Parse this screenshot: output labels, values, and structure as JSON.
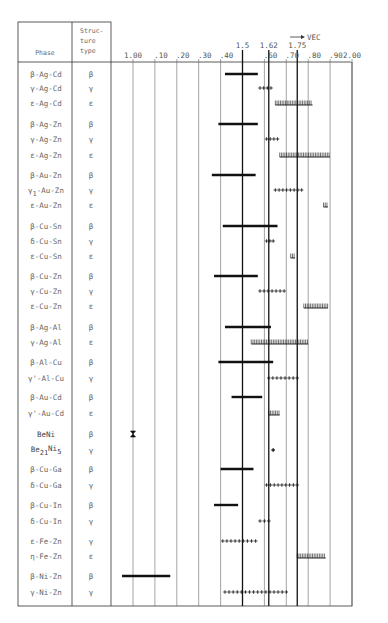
{
  "chart_data": {
    "type": "range",
    "title": "",
    "xlabel": "VEC",
    "xlabel_arrow": "→ VEC",
    "xlim": [
      1.0,
      2.0
    ],
    "grid": true,
    "table_headers": {
      "phase": "Phase",
      "structure_type": [
        "Struc-",
        "ture",
        "type"
      ]
    },
    "tick_labels": [
      {
        "value": 1.0,
        "label": "1.00"
      },
      {
        "value": 1.1,
        "label": ".10"
      },
      {
        "value": 1.2,
        "label": ".20"
      },
      {
        "value": 1.3,
        "label": ".30"
      },
      {
        "value": 1.4,
        "label": ".40"
      },
      {
        "value": 1.6,
        "label": ".60"
      },
      {
        "value": 1.7,
        "label": ".70"
      },
      {
        "value": 1.8,
        "label": ".80"
      },
      {
        "value": 1.9,
        "label": ".90"
      },
      {
        "value": 2.0,
        "label": "2.00"
      }
    ],
    "reference_lines": [
      {
        "value": 1.5,
        "label": "1.5"
      },
      {
        "value": 1.62,
        "label": "1.62"
      },
      {
        "value": 1.75,
        "label": "1.75"
      }
    ],
    "legend": {
      "β": "solid bar",
      "γ": "plus-marked line",
      "ε": "hatched (comb) line"
    },
    "rows": [
      {
        "phase": "β-Ag-Cd",
        "type": "β",
        "from": 1.42,
        "to": 1.57,
        "marker": "bar"
      },
      {
        "phase": "γ-Ag-Cd",
        "type": "γ",
        "from": 1.58,
        "to": 1.63,
        "marker": "plus"
      },
      {
        "phase": "ε-Ag-Cd",
        "type": "ε",
        "from": 1.65,
        "to": 1.82,
        "marker": "hatch"
      },
      {
        "phase": "β-Ag-Zn",
        "type": "β",
        "from": 1.39,
        "to": 1.57,
        "marker": "bar"
      },
      {
        "phase": "γ-Ag-Zn",
        "type": "γ",
        "from": 1.61,
        "to": 1.66,
        "marker": "plus"
      },
      {
        "phase": "ε-Ag-Zn",
        "type": "ε",
        "from": 1.67,
        "to": 1.9,
        "marker": "hatch"
      },
      {
        "phase": "β-Au-Zn",
        "type": "β",
        "from": 1.36,
        "to": 1.56,
        "marker": "bar"
      },
      {
        "phase": "γ1-Au-Zn",
        "type": "γ",
        "from": 1.65,
        "to": 1.77,
        "marker": "plus"
      },
      {
        "phase": "ε-Au-Zn",
        "type": "ε",
        "from": 1.87,
        "to": 1.89,
        "marker": "hatch"
      },
      {
        "phase": "β-Cu-Sn",
        "type": "β",
        "from": 1.41,
        "to": 1.66,
        "marker": "bar"
      },
      {
        "phase": "δ-Cu-Sn",
        "type": "γ",
        "from": 1.61,
        "to": 1.64,
        "marker": "plus"
      },
      {
        "phase": "ε-Cu-Sn",
        "type": "ε",
        "from": 1.72,
        "to": 1.74,
        "marker": "hatch"
      },
      {
        "phase": "β-Cu-Zn",
        "type": "β",
        "from": 1.37,
        "to": 1.57,
        "marker": "bar"
      },
      {
        "phase": "γ-Cu-Zn",
        "type": "γ",
        "from": 1.58,
        "to": 1.69,
        "marker": "plus"
      },
      {
        "phase": "ε-Cu-Zn",
        "type": "ε",
        "from": 1.78,
        "to": 1.89,
        "marker": "hatch"
      },
      {
        "phase": "β-Ag-Al",
        "type": "β",
        "from": 1.42,
        "to": 1.63,
        "marker": "bar"
      },
      {
        "phase": "γ-Ag-Al",
        "type": "ε",
        "from": 1.54,
        "to": 1.8,
        "marker": "hatch"
      },
      {
        "phase": "β-Al-Cu",
        "type": "β",
        "from": 1.39,
        "to": 1.64,
        "marker": "bar"
      },
      {
        "phase": "γ'-Al-Cu",
        "type": "γ",
        "from": 1.62,
        "to": 1.75,
        "marker": "plus"
      },
      {
        "phase": "β-Au-Cd",
        "type": "β",
        "from": 1.45,
        "to": 1.59,
        "marker": "bar"
      },
      {
        "phase": "γ'-Au-Cd",
        "type": "ε",
        "from": 1.62,
        "to": 1.67,
        "marker": "hatch"
      },
      {
        "phase": "BeNi",
        "type": "β",
        "from": 1.0,
        "to": 1.0,
        "marker": "point"
      },
      {
        "phase": "Be21Ni5",
        "type": "γ",
        "from": 1.64,
        "to": 1.64,
        "marker": "plus"
      },
      {
        "phase": "β-Cu-Ga",
        "type": "β",
        "from": 1.4,
        "to": 1.55,
        "marker": "bar"
      },
      {
        "phase": "δ-Cu-Ga",
        "type": "γ",
        "from": 1.61,
        "to": 1.75,
        "marker": "plus"
      },
      {
        "phase": "β-Cu-In",
        "type": "β",
        "from": 1.37,
        "to": 1.48,
        "marker": "bar"
      },
      {
        "phase": "δ-Cu-In",
        "type": "γ",
        "from": 1.58,
        "to": 1.62,
        "marker": "plus"
      },
      {
        "phase": "ε-Fe-Zn",
        "type": "γ",
        "from": 1.41,
        "to": 1.56,
        "marker": "plus"
      },
      {
        "phase": "η-Fe-Zn",
        "type": "ε",
        "from": 1.75,
        "to": 1.88,
        "marker": "hatch"
      },
      {
        "phase": "β-Ni-Zn",
        "type": "β",
        "from": 0.95,
        "to": 1.17,
        "marker": "bar"
      },
      {
        "phase": "γ-Ni-Zn",
        "type": "γ",
        "from": 1.42,
        "to": 1.7,
        "marker": "plus"
      }
    ]
  },
  "colors": {
    "line": "#333333",
    "grid": "#666666",
    "text": "#666666",
    "marker": "#111111"
  }
}
